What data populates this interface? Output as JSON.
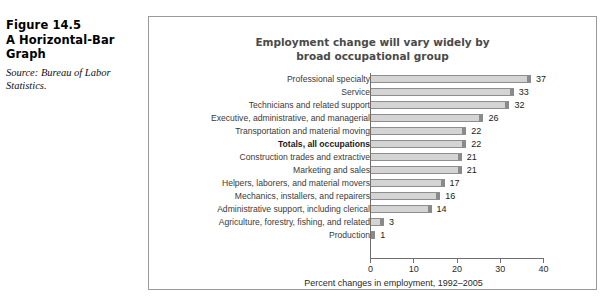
{
  "figure": {
    "heading_lines": [
      "Figure 14.5",
      "A Horizontal-Bar",
      "Graph"
    ],
    "source_lines": [
      "Source: Bureau of Labor",
      "Statistics."
    ]
  },
  "chart_data": {
    "type": "bar",
    "orientation": "horizontal",
    "title": "Employment change will vary widely by broad occupational group",
    "title_lines": [
      "Employment change will vary widely by",
      "broad occupational group"
    ],
    "xlabel": "Percent changes in employment, 1992–2005",
    "ylabel": "",
    "xlim": [
      0,
      40
    ],
    "xticks": [
      0,
      10,
      20,
      30,
      40
    ],
    "xtick_labels": [
      "0",
      "10",
      "20",
      "30",
      "40"
    ],
    "grid": false,
    "legend": false,
    "categories": [
      "Professional specialty",
      "Service",
      "Technicians and related support",
      "Executive, administrative, and managerial",
      "Transportation and material moving",
      "Totals, all occupations",
      "Construction trades and extractive",
      "Marketing and sales",
      "Helpers, laborers, and material movers",
      "Mechanics, installers, and repairers",
      "Administrative support, including clerical",
      "Agriculture, forestry, fishing, and related",
      "Production"
    ],
    "values": [
      37,
      33,
      32,
      26,
      22,
      22,
      21,
      21,
      17,
      16,
      14,
      3,
      1
    ],
    "value_labels": [
      "37",
      "33",
      "32",
      "26",
      "22",
      "22",
      "21",
      "21",
      "17",
      "16",
      "14",
      "3",
      "1"
    ],
    "emphasized_index": 5,
    "colors": {
      "bar_fill": "#d4d4d4",
      "bar_edge": "#8e8e8e",
      "bar_cap": "#8a8a8a",
      "title_text": "#4a4a4a",
      "axis": "#6e6e6e",
      "frame": "#9a9a9a",
      "background": "#ffffff"
    }
  }
}
